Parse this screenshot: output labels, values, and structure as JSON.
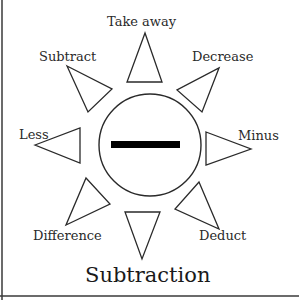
{
  "diagram": {
    "title": "Subtraction",
    "center_symbol": "minus-sign",
    "rays": [
      {
        "label": "Take away"
      },
      {
        "label": "Decrease"
      },
      {
        "label": "Minus"
      },
      {
        "label": "Deduct"
      },
      {
        "label": "Difference"
      },
      {
        "label": "Less"
      },
      {
        "label": "Subtract"
      }
    ],
    "colors": {
      "stroke": "#2a2a2a",
      "bar": "#000000",
      "background": "#ffffff"
    }
  }
}
